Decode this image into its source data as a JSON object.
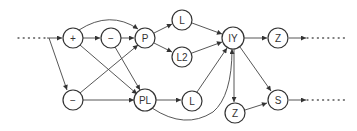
{
  "diagram": {
    "type": "directed-graph",
    "nodes": [
      {
        "id": "plus",
        "label": "+"
      },
      {
        "id": "minus_top",
        "label": "−"
      },
      {
        "id": "P",
        "label": "P"
      },
      {
        "id": "L_top",
        "label": "L"
      },
      {
        "id": "L2",
        "label": "L2"
      },
      {
        "id": "IY",
        "label": "IY"
      },
      {
        "id": "Z_top",
        "label": "Z"
      },
      {
        "id": "minus_bottom",
        "label": "−"
      },
      {
        "id": "PL",
        "label": "PL"
      },
      {
        "id": "L_bottom",
        "label": "L"
      },
      {
        "id": "Z_bottom",
        "label": "Z"
      },
      {
        "id": "S",
        "label": "S"
      }
    ],
    "edges": [
      {
        "from": "input",
        "to": "plus"
      },
      {
        "from": "input",
        "to": "minus_bottom"
      },
      {
        "from": "plus",
        "to": "minus_top"
      },
      {
        "from": "plus",
        "to": "P"
      },
      {
        "from": "plus",
        "to": "PL"
      },
      {
        "from": "minus_top",
        "to": "P"
      },
      {
        "from": "minus_top",
        "to": "PL"
      },
      {
        "from": "minus_bottom",
        "to": "P"
      },
      {
        "from": "minus_bottom",
        "to": "PL"
      },
      {
        "from": "P",
        "to": "L_top"
      },
      {
        "from": "P",
        "to": "L2"
      },
      {
        "from": "L_top",
        "to": "IY"
      },
      {
        "from": "L2",
        "to": "IY"
      },
      {
        "from": "PL",
        "to": "L_bottom"
      },
      {
        "from": "PL",
        "to": "IY"
      },
      {
        "from": "L_bottom",
        "to": "IY"
      },
      {
        "from": "IY",
        "to": "Z_top"
      },
      {
        "from": "IY",
        "to": "Z_bottom"
      },
      {
        "from": "IY",
        "to": "S"
      },
      {
        "from": "Z_bottom",
        "to": "S"
      },
      {
        "from": "Z_top",
        "to": "output"
      },
      {
        "from": "S",
        "to": "output"
      }
    ]
  }
}
